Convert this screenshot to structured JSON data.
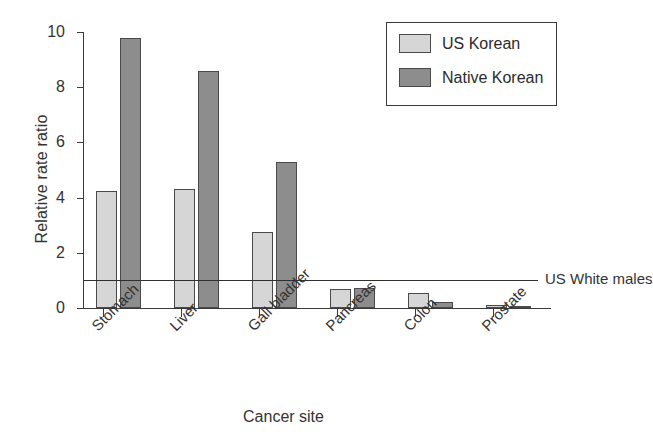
{
  "chart_data": {
    "type": "bar",
    "title": "",
    "xlabel": "Cancer site",
    "ylabel": "Relative rate ratio",
    "categories": [
      "Stomach",
      "Liver",
      "Gall bladder",
      "Pancreas",
      "Colon",
      "Prostate"
    ],
    "series": [
      {
        "name": "US Korean",
        "color": "#d6d6d6",
        "values": [
          4.25,
          4.3,
          2.75,
          0.68,
          0.55,
          0.1
        ]
      },
      {
        "name": "Native Korean",
        "color": "#8d8d8d",
        "values": [
          9.8,
          8.6,
          5.3,
          0.72,
          0.2,
          0.02
        ]
      }
    ],
    "ylim": [
      0,
      10
    ],
    "yticks": [
      0,
      2,
      4,
      6,
      8,
      10
    ],
    "ytick_labels": [
      "0",
      "2",
      "4",
      "6",
      "8",
      "10"
    ],
    "grid": false,
    "legend_position": "top-right",
    "reference_line": {
      "label": "US White males",
      "value": 1.0
    }
  },
  "legend": {
    "entries": [
      {
        "label": "US Korean"
      },
      {
        "label": "Native Korean"
      }
    ]
  }
}
